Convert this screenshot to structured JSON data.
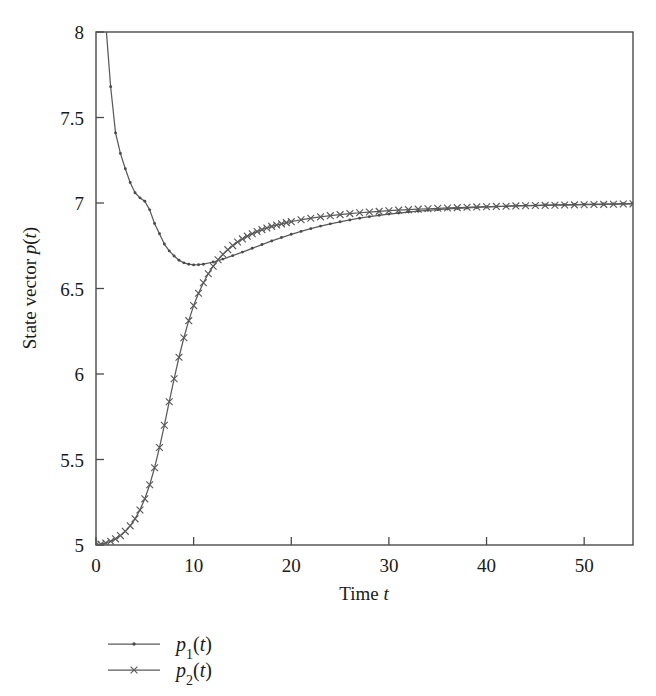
{
  "figure": {
    "background_color": "#ffffff",
    "line_color": "#5a5a5a",
    "axis_color": "#4a4a4a",
    "text_color": "#1a1a1a"
  },
  "chart_data": {
    "type": "line",
    "title": "",
    "xlabel": "Time t",
    "ylabel": "State vector p(t)",
    "xlim": [
      0,
      55
    ],
    "ylim": [
      5,
      8
    ],
    "xticks": [
      0,
      10,
      20,
      30,
      40,
      50
    ],
    "xticklabels": [
      "0",
      "10",
      "20",
      "30",
      "40",
      "50"
    ],
    "yticks": [
      5,
      5.5,
      6,
      6.5,
      7,
      7.5,
      8
    ],
    "yticklabels": [
      "5",
      "5.5",
      "6",
      "6.5",
      "7",
      "7.5",
      "8"
    ],
    "grid": false,
    "legend_position": "below-left",
    "frame": "box",
    "series": [
      {
        "name": "p_1(t)",
        "label_base": "p",
        "label_sub": "1",
        "label_arg": "(t)",
        "marker": "dot",
        "color": "#5a5a5a",
        "x": [
          0.0,
          0.5,
          1.0,
          1.5,
          2.0,
          2.5,
          3.0,
          3.5,
          4.0,
          4.5,
          5.0,
          5.5,
          6.0,
          6.5,
          7.0,
          7.5,
          8.0,
          8.5,
          9.0,
          9.5,
          10.0,
          10.5,
          11.0,
          12.0,
          13.0,
          14.0,
          15.0,
          16.0,
          17.0,
          18.0,
          19.0,
          20.0,
          21.0,
          22.0,
          23.0,
          24.0,
          25.0,
          26.0,
          27.0,
          28.0,
          29.0,
          30.0,
          31.0,
          32.0,
          33.0,
          34.0,
          35.0,
          36.0,
          37.0,
          38.0,
          39.0,
          40.0,
          41.0,
          42.0,
          43.0,
          44.0,
          45.0,
          46.0,
          47.0,
          48.0,
          49.0,
          50.0,
          51.0,
          52.0,
          53.0,
          54.0,
          55.0
        ],
        "y": [
          9.35,
          8.6,
          8.05,
          7.68,
          7.41,
          7.29,
          7.2,
          7.12,
          7.06,
          7.03,
          7.01,
          6.96,
          6.88,
          6.82,
          6.76,
          6.72,
          6.69,
          6.665,
          6.65,
          6.642,
          6.638,
          6.639,
          6.642,
          6.655,
          6.672,
          6.692,
          6.713,
          6.735,
          6.757,
          6.778,
          6.798,
          6.817,
          6.834,
          6.85,
          6.865,
          6.878,
          6.89,
          6.901,
          6.911,
          6.92,
          6.928,
          6.935,
          6.941,
          6.947,
          6.952,
          6.957,
          6.961,
          6.965,
          6.968,
          6.971,
          6.974,
          6.977,
          6.979,
          6.981,
          6.983,
          6.985,
          6.986,
          6.988,
          6.989,
          6.99,
          6.991,
          6.992,
          6.993,
          6.994,
          6.995,
          6.996,
          6.997
        ]
      },
      {
        "name": "p_2(t)",
        "label_base": "p",
        "label_sub": "2",
        "label_arg": "(t)",
        "marker": "x",
        "color": "#5a5a5a",
        "x": [
          0.0,
          0.5,
          1.0,
          1.5,
          2.0,
          2.5,
          3.0,
          3.5,
          4.0,
          4.5,
          5.0,
          5.5,
          6.0,
          6.5,
          7.0,
          7.5,
          8.0,
          8.5,
          9.0,
          9.5,
          10.0,
          10.5,
          11.0,
          11.5,
          12.0,
          12.5,
          13.0,
          13.5,
          14.0,
          14.5,
          15.0,
          15.5,
          16.0,
          16.5,
          17.0,
          17.5,
          18.0,
          18.5,
          19.0,
          19.5,
          20.0,
          21.0,
          22.0,
          23.0,
          24.0,
          25.0,
          26.0,
          27.0,
          28.0,
          29.0,
          30.0,
          31.0,
          32.0,
          33.0,
          34.0,
          35.0,
          36.0,
          37.0,
          38.0,
          39.0,
          40.0,
          41.0,
          42.0,
          43.0,
          44.0,
          45.0,
          46.0,
          47.0,
          48.0,
          49.0,
          50.0,
          51.0,
          52.0,
          53.0,
          54.0,
          55.0
        ],
        "y": [
          5.0,
          5.005,
          5.012,
          5.022,
          5.036,
          5.055,
          5.08,
          5.112,
          5.153,
          5.205,
          5.27,
          5.352,
          5.452,
          5.57,
          5.7,
          5.838,
          5.972,
          6.098,
          6.212,
          6.312,
          6.4,
          6.472,
          6.534,
          6.586,
          6.63,
          6.668,
          6.7,
          6.727,
          6.751,
          6.772,
          6.79,
          6.806,
          6.82,
          6.833,
          6.844,
          6.854,
          6.863,
          6.871,
          6.878,
          6.885,
          6.891,
          6.902,
          6.911,
          6.919,
          6.926,
          6.932,
          6.938,
          6.943,
          6.947,
          6.951,
          6.955,
          6.958,
          6.961,
          6.964,
          6.966,
          6.969,
          6.971,
          6.973,
          6.975,
          6.977,
          6.978,
          6.98,
          6.981,
          6.983,
          6.984,
          6.985,
          6.986,
          6.987,
          6.988,
          6.989,
          6.99,
          6.991,
          6.992,
          6.993,
          6.994,
          6.995
        ]
      }
    ]
  }
}
